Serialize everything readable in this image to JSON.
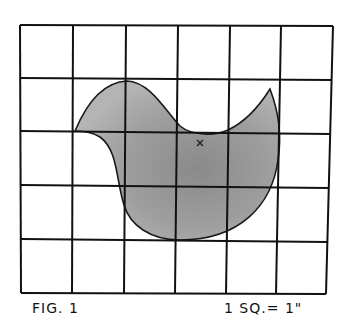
{
  "figure": {
    "label": "FIG. 1",
    "scale": "1 SQ.= 1\"",
    "grid": {
      "columns": 6,
      "rows": 5,
      "line_color": "#111111",
      "vertical_lines_top": [
        20,
        73,
        126,
        178,
        230,
        281,
        333
      ],
      "vertical_lines_bottom": [
        21,
        72,
        124,
        175,
        226,
        276,
        326
      ],
      "horizontal_lines_left": [
        25,
        78,
        131,
        185,
        239,
        293
      ],
      "horizontal_lines_right": [
        26,
        79,
        132,
        186,
        240,
        294
      ]
    },
    "shape": {
      "name": "bird-silhouette",
      "fill_color": "#9a9a9a",
      "outline_color": "#1a1a1a",
      "marker": "×"
    }
  }
}
